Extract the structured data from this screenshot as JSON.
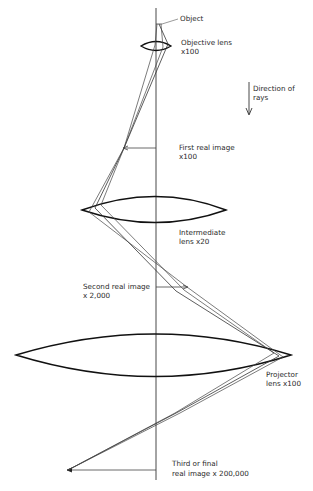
{
  "diagram": {
    "title": "",
    "labels": {
      "object": "Object",
      "objective_lens_line1": "Objective lens",
      "objective_lens_line2": "x100",
      "direction_line1": "Direction of",
      "direction_line2": "rays",
      "first_image_line1": "First real image",
      "first_image_line2": "x100",
      "intermediate_lens_line1": "Intermediate",
      "intermediate_lens_line2": "lens x20",
      "second_image_line1": "Second real image",
      "second_image_line2": "x 2,000",
      "projector_lens_line1": "Projector",
      "projector_lens_line2": "lens x100",
      "third_image_line1": "Third or final",
      "third_image_line2": "real image x 200,000"
    },
    "stages": [
      {
        "name": "Objective lens",
        "magnification": "x100"
      },
      {
        "name": "Intermediate lens",
        "magnification": "x20"
      },
      {
        "name": "Projector lens",
        "magnification": "x100"
      }
    ],
    "images": [
      {
        "name": "First real image",
        "magnification": "x100"
      },
      {
        "name": "Second real image",
        "magnification": "x2,000"
      },
      {
        "name": "Third or final real image",
        "magnification": "x200,000"
      }
    ]
  }
}
